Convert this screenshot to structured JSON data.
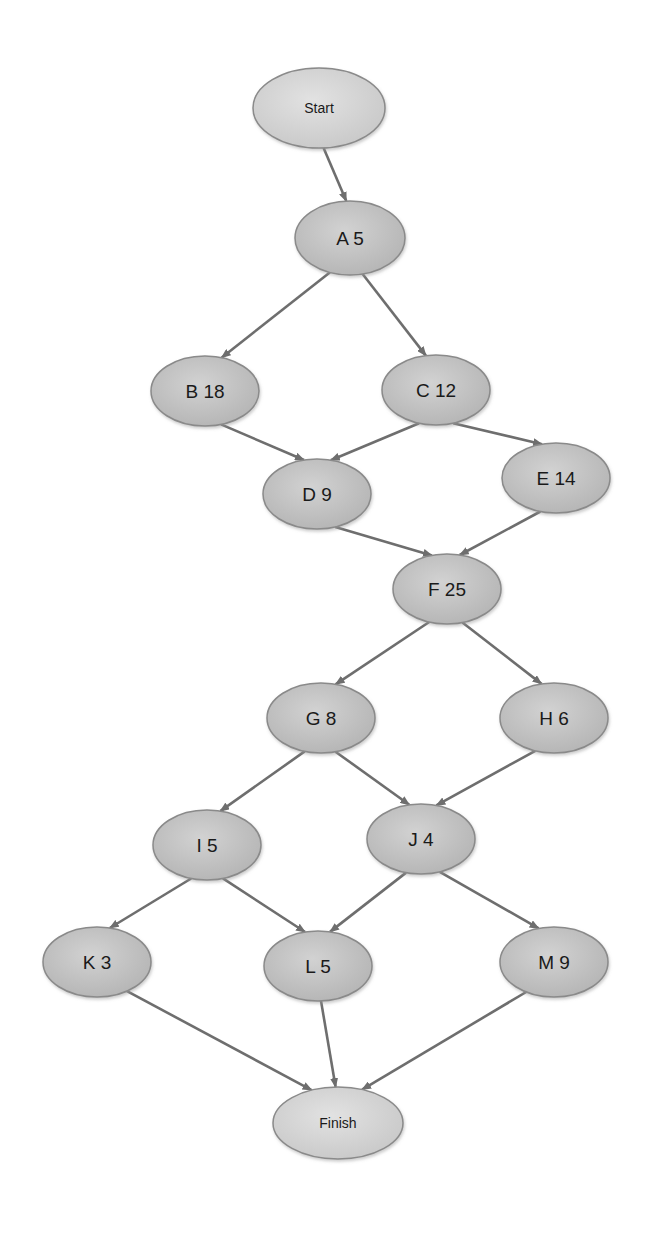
{
  "diagram": {
    "type": "activity-on-node network",
    "colors": {
      "background": "#ffffff",
      "task_fill": "#c4c4c4",
      "terminal_fill": "#d6d6d6",
      "edge": "#6e6e6e",
      "text": "#1a1a1a"
    },
    "nodes": [
      {
        "id": "Start",
        "label": "Start",
        "kind": "terminal",
        "cx": 319,
        "cy": 108,
        "rx": 66,
        "ry": 40
      },
      {
        "id": "A",
        "label": "A 5",
        "kind": "task",
        "duration": 5,
        "cx": 350,
        "cy": 238,
        "rx": 55,
        "ry": 37
      },
      {
        "id": "B",
        "label": "B 18",
        "kind": "task",
        "duration": 18,
        "cx": 205,
        "cy": 391,
        "rx": 54,
        "ry": 35
      },
      {
        "id": "C",
        "label": "C 12",
        "kind": "task",
        "duration": 12,
        "cx": 436,
        "cy": 390,
        "rx": 54,
        "ry": 35
      },
      {
        "id": "D",
        "label": "D 9",
        "kind": "task",
        "duration": 9,
        "cx": 317,
        "cy": 494,
        "rx": 54,
        "ry": 35
      },
      {
        "id": "E",
        "label": "E 14",
        "kind": "task",
        "duration": 14,
        "cx": 556,
        "cy": 478,
        "rx": 54,
        "ry": 35
      },
      {
        "id": "F",
        "label": "F 25",
        "kind": "task",
        "duration": 25,
        "cx": 447,
        "cy": 589,
        "rx": 54,
        "ry": 35
      },
      {
        "id": "G",
        "label": "G 8",
        "kind": "task",
        "duration": 8,
        "cx": 321,
        "cy": 718,
        "rx": 54,
        "ry": 35
      },
      {
        "id": "H",
        "label": "H 6",
        "kind": "task",
        "duration": 6,
        "cx": 554,
        "cy": 718,
        "rx": 54,
        "ry": 35
      },
      {
        "id": "I",
        "label": "I 5",
        "kind": "task",
        "duration": 5,
        "cx": 207,
        "cy": 845,
        "rx": 54,
        "ry": 35
      },
      {
        "id": "J",
        "label": "J 4",
        "kind": "task",
        "duration": 4,
        "cx": 421,
        "cy": 839,
        "rx": 54,
        "ry": 35
      },
      {
        "id": "K",
        "label": "K 3",
        "kind": "task",
        "duration": 3,
        "cx": 97,
        "cy": 962,
        "rx": 54,
        "ry": 35
      },
      {
        "id": "L",
        "label": "L 5",
        "kind": "task",
        "duration": 5,
        "cx": 318,
        "cy": 966,
        "rx": 54,
        "ry": 35
      },
      {
        "id": "M",
        "label": "M 9",
        "kind": "task",
        "duration": 9,
        "cx": 554,
        "cy": 962,
        "rx": 54,
        "ry": 35
      },
      {
        "id": "Finish",
        "label": "Finish",
        "kind": "terminal",
        "cx": 338,
        "cy": 1123,
        "rx": 65,
        "ry": 36
      }
    ],
    "edges": [
      {
        "from": "Start",
        "to": "A"
      },
      {
        "from": "A",
        "to": "B"
      },
      {
        "from": "A",
        "to": "C"
      },
      {
        "from": "B",
        "to": "D"
      },
      {
        "from": "C",
        "to": "D"
      },
      {
        "from": "C",
        "to": "E"
      },
      {
        "from": "D",
        "to": "F"
      },
      {
        "from": "E",
        "to": "F"
      },
      {
        "from": "F",
        "to": "G"
      },
      {
        "from": "F",
        "to": "H"
      },
      {
        "from": "G",
        "to": "I"
      },
      {
        "from": "G",
        "to": "J"
      },
      {
        "from": "H",
        "to": "J"
      },
      {
        "from": "I",
        "to": "K"
      },
      {
        "from": "I",
        "to": "L"
      },
      {
        "from": "J",
        "to": "L"
      },
      {
        "from": "J",
        "to": "M"
      },
      {
        "from": "K",
        "to": "Finish"
      },
      {
        "from": "L",
        "to": "Finish"
      },
      {
        "from": "M",
        "to": "Finish"
      }
    ]
  }
}
